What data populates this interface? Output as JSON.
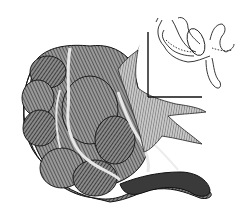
{
  "figure": {
    "background": "#ffffff",
    "ink": "#1a1a1a",
    "inset": {
      "subject": "outline diagram of intestinal loops",
      "has_corner_axes": true
    }
  }
}
